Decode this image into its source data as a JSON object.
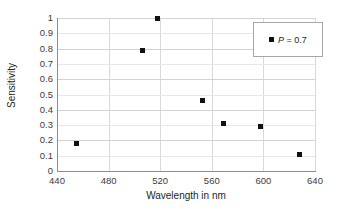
{
  "chart_data": {
    "type": "scatter",
    "title": "",
    "xlabel": "Wavelength in nm",
    "ylabel": "Sensitivity",
    "xlim": [
      440,
      640
    ],
    "ylim": [
      0,
      1
    ],
    "xticks": [
      440,
      480,
      520,
      560,
      600,
      640
    ],
    "yticks": [
      "0",
      "0.1",
      "0.2",
      "0.3",
      "0.4",
      "0.5",
      "0.6",
      "0.7",
      "0.8",
      "0.9",
      "1"
    ],
    "grid": true,
    "legend_position": "top-right",
    "marker": "filled-square",
    "marker_color": "#111111",
    "series": [
      {
        "name": "P = 0.7",
        "legend_label_prefix": "P",
        "legend_label_suffix": " = 0.7",
        "points": [
          {
            "x": 455,
            "y": 0.18
          },
          {
            "x": 506,
            "y": 0.79
          },
          {
            "x": 518,
            "y": 1.0
          },
          {
            "x": 553,
            "y": 0.46
          },
          {
            "x": 569,
            "y": 0.31
          },
          {
            "x": 598,
            "y": 0.29
          },
          {
            "x": 628,
            "y": 0.11
          }
        ]
      }
    ]
  },
  "colors": {
    "marker": "#111111",
    "grid_major": "#d3d3d3",
    "grid_minor": "#e8e8e8",
    "axis": "#8c8c8c",
    "text": "#231f20",
    "background": "#ffffff"
  }
}
